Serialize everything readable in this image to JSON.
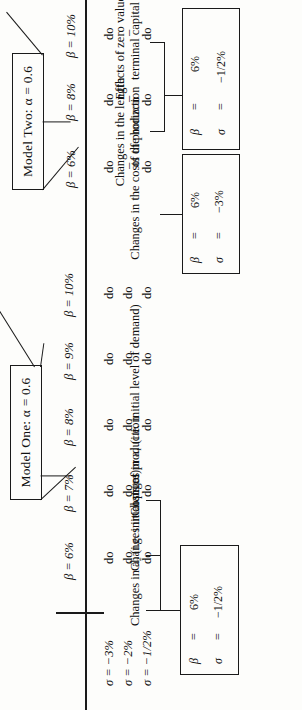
{
  "figure": {
    "orientation": "rotated-90-ccw",
    "rule_color": "#1a1a1a"
  },
  "model_one": {
    "title": "Model One: α = 0.6",
    "column_headers": [
      "β = 6%",
      "β = 7%",
      "β = 8%",
      "β = 9%",
      "β = 10%"
    ],
    "row_labels": [
      "σ = −3%",
      "σ = −2%",
      "σ = −1/2%"
    ],
    "cells": [
      [
        "do",
        "do",
        "do",
        "do",
        "do"
      ],
      [
        "do",
        "do",
        "do",
        "do",
        "do"
      ],
      [
        "do",
        "do",
        "do",
        "do",
        "do"
      ]
    ]
  },
  "model_two": {
    "title": "Model Two: α = 0.6",
    "column_headers": [
      "β = 6%",
      "β = 8%",
      "β = 10%"
    ],
    "row_labels": [
      "σ = −3%",
      "σ = −2%",
      "σ = −1/2%"
    ],
    "cells": [
      [
        "do",
        "do",
        "do"
      ],
      [
        "–",
        "–",
        "–"
      ],
      [
        "do",
        "do",
        "do"
      ]
    ]
  },
  "callouts": {
    "base_case": {
      "lines": [
        "β  =    6%",
        "σ  =  −1/2%"
      ],
      "beta_label": "β",
      "sigma_label": "σ",
      "eq": "=",
      "beta_value": "6%",
      "sigma_value": "−1/2%",
      "annotations": [
        "Changes in a₂ (i.e. initial price)",
        "Changes in costs of production",
        "Changes in a₁ (i.e. initial level of demand)"
      ]
    },
    "upper_box": {
      "beta_label": "β",
      "sigma_label": "σ",
      "eq": "=",
      "beta_value": "6%",
      "sigma_value": "−3%",
      "annotation": "Changes in the costs of production"
    },
    "lower_box": {
      "beta_label": "β",
      "sigma_label": "σ",
      "eq": "=",
      "beta_value": "6%",
      "sigma_value": "−1/2%",
      "annotations": [
        "Changes in the length of the horizon",
        "Effects of zero value of terminal capital"
      ]
    }
  }
}
